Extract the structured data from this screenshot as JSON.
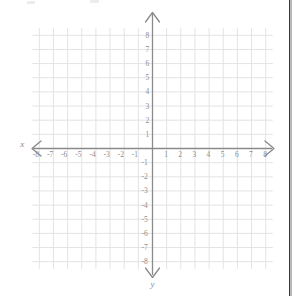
{
  "page": {
    "background_color": "#ffffff",
    "width": 299,
    "height": 296
  },
  "page_edge": {
    "name": "scanned page right edge",
    "color": "#3a3a3a"
  },
  "chart_data": {
    "type": "scatter",
    "title": "",
    "subtitle": "",
    "xlabel": "x",
    "ylabel": "y",
    "xlim": [
      -8.5,
      8.5
    ],
    "ylim": [
      -8.5,
      8.5
    ],
    "grid": true,
    "grid_spacing": 1,
    "legend": "none",
    "series": [
      {
        "name": "",
        "x": [],
        "y": []
      }
    ],
    "annotations": [],
    "x_ticks": [
      -8,
      -7,
      -6,
      -5,
      -4,
      -3,
      -2,
      -1,
      1,
      2,
      3,
      4,
      5,
      6,
      7,
      8
    ],
    "y_ticks": [
      8,
      7,
      6,
      5,
      4,
      3,
      2,
      1,
      -1,
      -2,
      -3,
      -4,
      -5,
      -6,
      -7,
      -8
    ],
    "x_tick_labels": [
      "-8",
      "-7",
      "-6",
      "-5",
      "-4",
      "-3",
      "-2",
      "-1",
      "1",
      "2",
      "3",
      "4",
      "5",
      "6",
      "7",
      "8"
    ],
    "y_tick_labels": [
      "8",
      "7",
      "6",
      "5",
      "4",
      "3",
      "2",
      "1",
      "-1",
      "-2",
      "-3",
      "-4",
      "-5",
      "-6",
      "-7",
      "-8"
    ],
    "colors": {
      "grid": "#e3e3e6",
      "axis": "#8a8a8a",
      "tick_text": "#8c8c8c",
      "axis_label": "#8a8a8a"
    }
  },
  "axis_labels": {
    "x": "x",
    "y": "y"
  }
}
